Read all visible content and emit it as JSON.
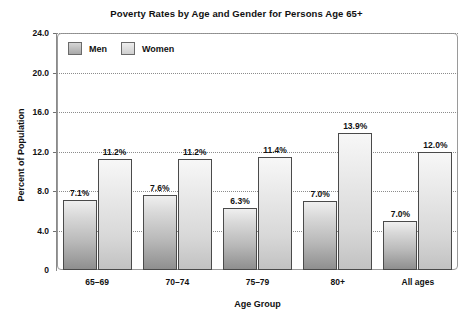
{
  "chart_data": {
    "type": "bar",
    "title": "Poverty Rates by Age and Gender for Persons Age 65+",
    "xlabel": "Age Group",
    "ylabel": "Percent of Population",
    "categories": [
      "65–69",
      "70–74",
      "75–79",
      "80+",
      "All ages"
    ],
    "series": [
      {
        "name": "Men",
        "values": [
          7.1,
          7.6,
          6.3,
          7.0,
          7.0
        ],
        "labels": [
          "7.1%",
          "7.6%",
          "6.3%",
          "7.0%",
          "7.0%"
        ],
        "drawn_heights": [
          7.1,
          7.6,
          6.3,
          7.0,
          5.0
        ]
      },
      {
        "name": "Women",
        "values": [
          11.2,
          11.2,
          11.4,
          13.9,
          12.0
        ],
        "labels": [
          "11.2%",
          "11.2%",
          "11.4%",
          "13.9%",
          "12.0%"
        ],
        "drawn_heights": [
          11.2,
          11.2,
          11.4,
          13.9,
          12.0
        ]
      }
    ],
    "ylim": [
      0,
      24
    ],
    "yticks": [
      0,
      4,
      8,
      12,
      16,
      20,
      24
    ],
    "ytick_labels": [
      "0",
      "4.0",
      "8.0",
      "12.0",
      "16.0",
      "20.0",
      "24.0"
    ],
    "grid": true,
    "legend_position": "top-left-inside",
    "colors": {
      "men_bar_top": "#efefef",
      "men_bar_bottom": "#8f8f8f",
      "women_bar_top": "#f7f7f7",
      "women_bar_bottom": "#c2c2c2",
      "bar_border": "#4a4a4a",
      "gridline": "#8c8c8c",
      "frame": "#9a9a9a",
      "text": "#111111",
      "background": "#ffffff"
    }
  },
  "legend": {
    "items": [
      {
        "label": "Men"
      },
      {
        "label": "Women"
      }
    ]
  }
}
